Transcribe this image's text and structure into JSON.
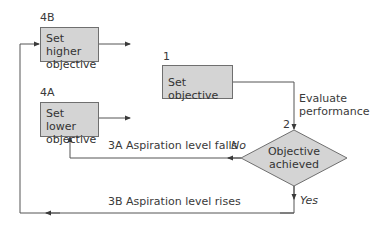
{
  "diagram": {
    "nodes": [
      {
        "id": "4B",
        "number": "4B",
        "label_line1": "Set higher",
        "label_line2": "objective"
      },
      {
        "id": "1",
        "number": "1",
        "label": "Set objective"
      },
      {
        "id": "4A",
        "number": "4A",
        "label_line1": "Set lower",
        "label_line2": "objective"
      },
      {
        "id": "2",
        "number": "2",
        "label_line1": "Objective",
        "label_line2": "achieved"
      }
    ],
    "edge_labels": {
      "evaluate_line1": "Evaluate",
      "evaluate_line2": "performance",
      "falls": "3A Aspiration level falls",
      "rises": "3B Aspiration level rises",
      "no": "No",
      "yes": "Yes"
    },
    "colors": {
      "box_fill": "#d4d4d4",
      "box_border": "#6f6f6f",
      "line": "#4a4a4a"
    }
  }
}
